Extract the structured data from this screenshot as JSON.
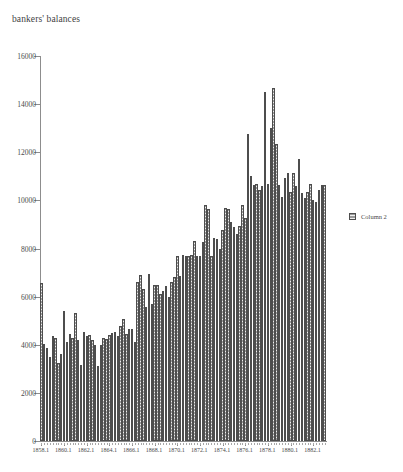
{
  "chart_data": {
    "type": "bar",
    "title": "bankers' balances",
    "xlabel": "",
    "ylabel": "",
    "ylim": [
      0,
      16000
    ],
    "ytick_values": [
      0,
      2000,
      4000,
      6000,
      8000,
      10000,
      12000,
      14000,
      16000
    ],
    "ytick_labels": [
      "0",
      "2000",
      "4000",
      "6000",
      "8000",
      "10000",
      "12000",
      "14000",
      "16000"
    ],
    "grid": false,
    "legend_position": "right",
    "legend": [
      "Column 2"
    ],
    "xtick_labels": [
      "1858.1",
      "1860.1",
      "1862.1",
      "1864.1",
      "1866.1",
      "1868.1",
      "1870.1",
      "1872.1",
      "1874.1",
      "1876.1",
      "1878.1",
      "1880.1",
      "1882.1"
    ],
    "categories": [
      "1858.1",
      "1858.2",
      "1858.3",
      "1858.4",
      "1859.1",
      "1859.2",
      "1859.3",
      "1859.4",
      "1860.1",
      "1860.2",
      "1860.3",
      "1860.4",
      "1861.1",
      "1861.2",
      "1861.3",
      "1861.4",
      "1862.1",
      "1862.2",
      "1862.3",
      "1862.4",
      "1863.1",
      "1863.2",
      "1863.3",
      "1863.4",
      "1864.1",
      "1864.2",
      "1864.3",
      "1864.4",
      "1865.1",
      "1865.2",
      "1865.3",
      "1865.4",
      "1866.1",
      "1866.2",
      "1866.3",
      "1866.4",
      "1867.1",
      "1867.2",
      "1867.3",
      "1867.4",
      "1868.1",
      "1868.2",
      "1868.3",
      "1868.4",
      "1869.1",
      "1869.2",
      "1869.3",
      "1869.4",
      "1870.1",
      "1870.2",
      "1870.3",
      "1870.4",
      "1871.1",
      "1871.2",
      "1871.3",
      "1871.4",
      "1872.1",
      "1872.2",
      "1872.3",
      "1872.4",
      "1873.1",
      "1873.2",
      "1873.3",
      "1873.4",
      "1874.1",
      "1874.2",
      "1874.3",
      "1874.4",
      "1875.1",
      "1875.2",
      "1875.3",
      "1875.4",
      "1876.1",
      "1876.2",
      "1876.3",
      "1876.4",
      "1877.1",
      "1877.2",
      "1877.3",
      "1877.4",
      "1878.1",
      "1878.2",
      "1878.3",
      "1878.4",
      "1879.1",
      "1879.2",
      "1879.3",
      "1879.4",
      "1880.1",
      "1880.2",
      "1880.3",
      "1880.4",
      "1881.1",
      "1881.2",
      "1881.3",
      "1881.4",
      "1882.1",
      "1882.2",
      "1882.3",
      "1882.4",
      "1883.1"
    ],
    "series": [
      {
        "name": "Column 2",
        "values": [
          6550,
          4050,
          3850,
          3500,
          4350,
          4300,
          3250,
          3600,
          5400,
          4100,
          4450,
          4300,
          5300,
          4200,
          3150,
          4550,
          4350,
          4400,
          4200,
          4000,
          3100,
          4000,
          4300,
          4250,
          4400,
          4500,
          4550,
          4350,
          4800,
          5050,
          4450,
          4650,
          4650,
          4100,
          6600,
          6900,
          6300,
          5550,
          6950,
          5700,
          6500,
          6500,
          6100,
          6250,
          6450,
          6000,
          6600,
          6800,
          7700,
          6850,
          7750,
          7700,
          7700,
          7750,
          8300,
          7700,
          7700,
          8250,
          9800,
          9650,
          7700,
          8450,
          8400,
          8000,
          8750,
          9700,
          9650,
          9100,
          8900,
          8600,
          8950,
          9800,
          9250,
          12750,
          11000,
          10650,
          10700,
          10450,
          10600,
          14500,
          10700,
          13000,
          14650,
          12350,
          10650,
          10150,
          10950,
          11150,
          10350,
          11150,
          10600,
          11700,
          10300,
          10100,
          10350,
          10700,
          10000,
          9950,
          10450,
          10650,
          10650
        ]
      }
    ]
  }
}
